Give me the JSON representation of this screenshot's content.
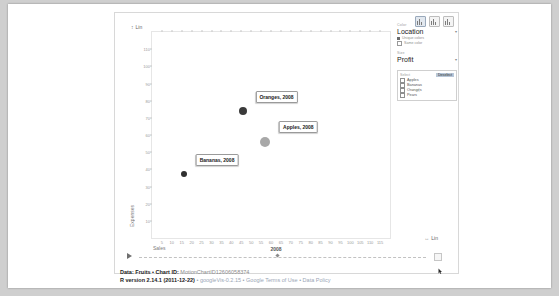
{
  "window": {
    "background": "#cfcfcf",
    "sheet_background": "#ffffff"
  },
  "chart_type_buttons": [
    {
      "name": "bubble-chart-button",
      "label": "Bubble",
      "selected": true
    },
    {
      "name": "bar-chart-button",
      "label": "Bars",
      "selected": false
    },
    {
      "name": "line-chart-button",
      "label": "Lines",
      "selected": false
    }
  ],
  "axis_scale": {
    "y_toggle": "Lin",
    "x_toggle": "Lin",
    "updown_icon": "updown-arrow-icon",
    "leftright_icon": "leftright-arrow-icon"
  },
  "panel": {
    "color_label": "Color",
    "color_value": "Location",
    "color_caret": "caret-down-icon",
    "color_options": [
      {
        "label": "Unique colors",
        "selected": true
      },
      {
        "label": "Same color",
        "selected": false
      }
    ],
    "size_label": "Size",
    "size_value": "Profit",
    "size_caret": "caret-down-icon",
    "legend_title": "Select",
    "legend_action": "Deselect",
    "legend_items": [
      {
        "label": "Apples",
        "checked": false
      },
      {
        "label": "Bananas",
        "checked": false
      },
      {
        "label": "Oranges",
        "checked": false
      },
      {
        "label": "Pears",
        "checked": false
      }
    ]
  },
  "timeline": {
    "play_icon": "play-icon",
    "year": "2008",
    "end_icon": "timeline-end-icon"
  },
  "caption": {
    "line1_bold": "Data: Fruits • Chart ID: ",
    "line1_id": "MotionChartID12606058374",
    "line2_bold": "R version 2.14.1 (2011-12-22) ",
    "line2_rest": "• googleVis-0.2.15 • Google Terms of Use • Data Policy"
  },
  "chart_data": {
    "type": "scatter",
    "title": "",
    "xlabel": "Sales",
    "ylabel": "Expenses",
    "xlim": [
      0,
      120
    ],
    "ylim": [
      0,
      120
    ],
    "xticks": [
      5,
      10,
      15,
      20,
      25,
      30,
      35,
      40,
      45,
      50,
      55,
      60,
      65,
      70,
      75,
      80,
      85,
      90,
      95,
      100,
      105,
      110,
      115
    ],
    "yticks": [
      10,
      20,
      30,
      40,
      50,
      60,
      70,
      80,
      90,
      100,
      110
    ],
    "grid": false,
    "legend_position": "right",
    "year": "2008",
    "points": [
      {
        "name": "Oranges",
        "label": "Oranges, 2008",
        "x": 46,
        "y": 74,
        "size": 8,
        "color": "#3a3a3a"
      },
      {
        "name": "Apples",
        "label": "Apples, 2008",
        "x": 57,
        "y": 56,
        "size": 10,
        "color": "#a8a8a8"
      },
      {
        "name": "Bananas",
        "label": "Bananas, 2008",
        "x": 16,
        "y": 37,
        "size": 6,
        "color": "#2f2f2f"
      }
    ]
  }
}
